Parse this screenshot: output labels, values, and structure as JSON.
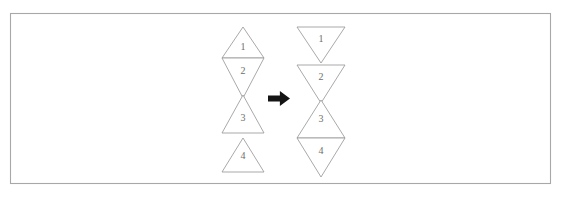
{
  "figure": {
    "background_color": "#ffffff",
    "border_color": "#a8a8a8",
    "shape_stroke_color": "#9a9a9a",
    "shape_fill_color": "#ffffff",
    "label_color": "#6d6d6d",
    "arrow_color": "#141414",
    "panel": {
      "x": 10,
      "y": 13,
      "width": 541,
      "height": 171
    }
  },
  "left_group": {
    "name": "before-stack",
    "center_x": 243,
    "half_width": 21,
    "triangles": [
      {
        "label": "1",
        "direction": "up",
        "top": 27,
        "bottom": 58,
        "label_x": 243,
        "label_y": 48
      },
      {
        "label": "2",
        "direction": "down",
        "top": 58,
        "bottom": 98,
        "label_x": 243,
        "label_y": 72
      },
      {
        "label": "3",
        "direction": "up",
        "top": 95,
        "bottom": 133,
        "label_x": 243,
        "label_y": 119
      },
      {
        "label": "4",
        "direction": "up",
        "top": 138,
        "bottom": 172,
        "label_x": 243,
        "label_y": 157
      }
    ]
  },
  "arrow": {
    "name": "transform-arrow",
    "glyph": "right-arrow-icon",
    "x": 268,
    "y": 91,
    "width": 22,
    "height": 15
  },
  "right_group": {
    "name": "after-stack",
    "center_x": 321,
    "half_width": 24,
    "triangles": [
      {
        "label": "1",
        "direction": "down",
        "top": 27,
        "bottom": 63,
        "label_x": 321,
        "label_y": 40
      },
      {
        "label": "2",
        "direction": "down",
        "top": 65,
        "bottom": 103,
        "label_x": 321,
        "label_y": 78
      },
      {
        "label": "3",
        "direction": "up",
        "top": 100,
        "bottom": 138,
        "label_x": 321,
        "label_y": 120
      },
      {
        "label": "4",
        "direction": "down",
        "top": 138,
        "bottom": 177,
        "label_x": 321,
        "label_y": 152
      }
    ]
  }
}
